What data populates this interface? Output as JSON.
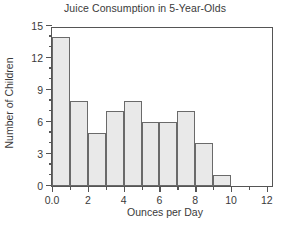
{
  "chart_data": {
    "type": "bar",
    "title": "Juice Consumption in 5-Year-Olds",
    "xlabel": "Ounces per Day",
    "ylabel": "Number of Children",
    "categories": [
      "0-1",
      "1-2",
      "2-3",
      "3-4",
      "4-5",
      "5-6",
      "6-7",
      "7-8",
      "8-9",
      "9-10"
    ],
    "bin_edges": [
      0,
      1,
      2,
      3,
      4,
      5,
      6,
      7,
      8,
      9,
      10
    ],
    "values": [
      14,
      8,
      5,
      7,
      8,
      6,
      6,
      7,
      4,
      1
    ],
    "xlim": [
      0,
      12.4
    ],
    "ylim": [
      0,
      15
    ],
    "x_major_ticks": [
      0,
      2,
      4,
      6,
      8,
      10,
      12
    ],
    "x_major_tick_labels": [
      "0.0",
      "2",
      "4",
      "6",
      "8",
      "10",
      "12"
    ],
    "x_minor_ticks": [
      1,
      3,
      5,
      7,
      9,
      11
    ],
    "y_major_ticks": [
      0,
      3,
      6,
      9,
      12,
      15
    ],
    "y_major_tick_labels": [
      "0",
      "3",
      "6",
      "9",
      "12",
      "15"
    ],
    "y_minor_ticks": [
      1,
      2,
      4,
      5,
      7,
      8,
      10,
      11,
      13,
      14
    ],
    "grid": false,
    "legend": false,
    "bar_fill_color": "#e9e9e9",
    "bar_edge_color": "#6a6a6a",
    "axis_color": "#555555",
    "background_color": "#ffffff"
  }
}
